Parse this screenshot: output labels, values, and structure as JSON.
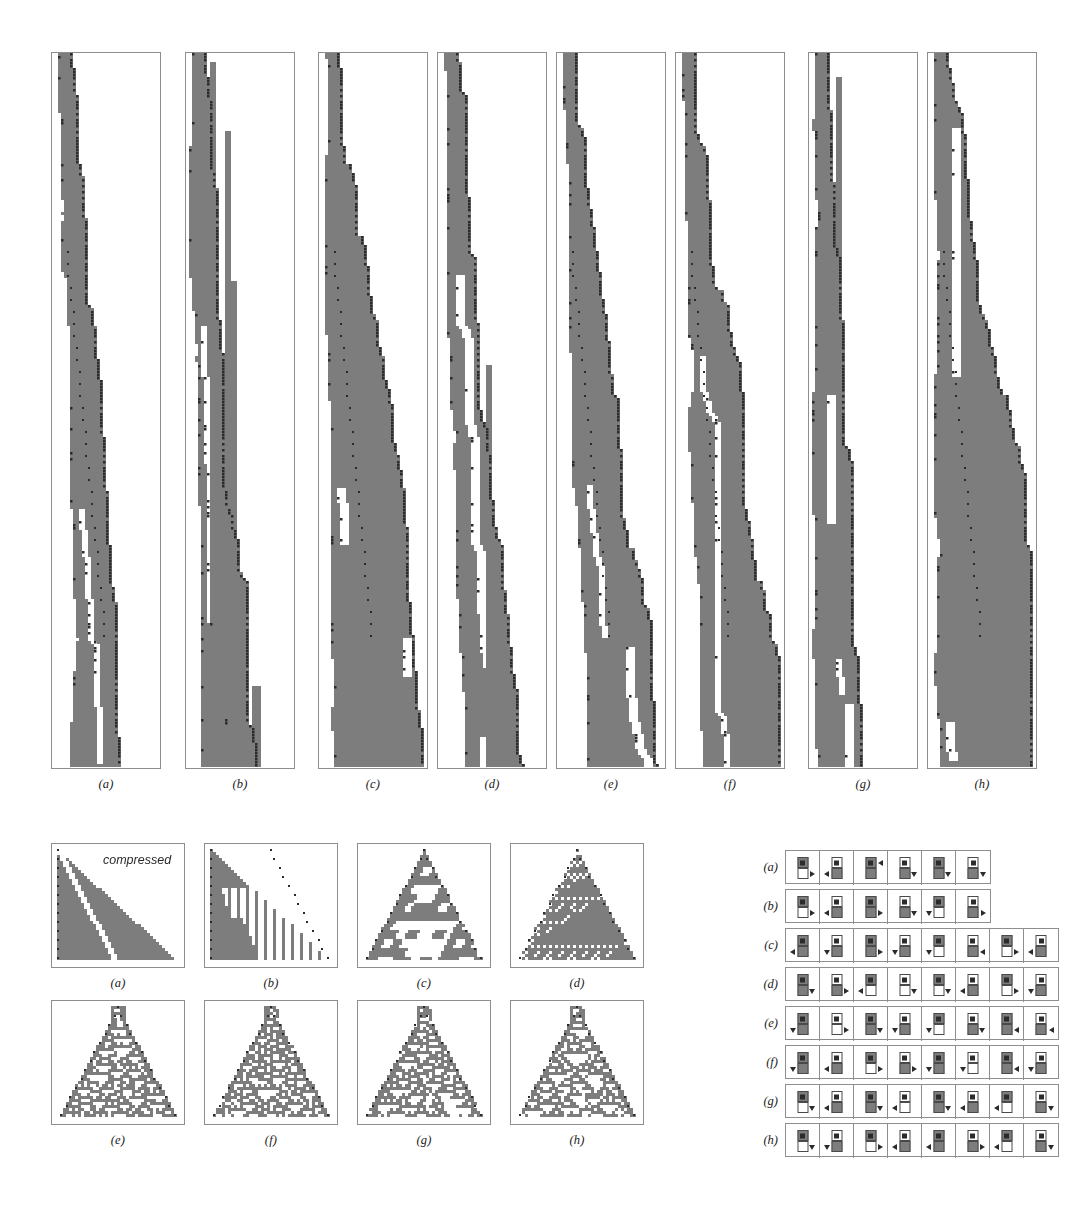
{
  "figure": {
    "background": "#ffffff",
    "cell_on_color": "#7d7d7d",
    "cell_off_color": "#ffffff",
    "head_marker_color": "#2b2b2b",
    "panel_border_color": "#8e8e8e"
  },
  "top_row": {
    "name": "long-evolution-strips",
    "panel_count": 8,
    "captions": [
      "(a)",
      "(b)",
      "(c)",
      "(d)",
      "(e)",
      "(f)",
      "(g)",
      "(h)"
    ]
  },
  "middle_block": {
    "name": "compressed-evolution-panels",
    "note": "compressed",
    "row1_captions": [
      "(a)",
      "(b)",
      "(c)",
      "(d)"
    ],
    "row2_captions": [
      "(e)",
      "(f)",
      "(g)",
      "(h)"
    ]
  },
  "rule_tables": {
    "name": "turing-machine-rule-tables",
    "rows": [
      {
        "label": "(a)",
        "cells": [
          {
            "in_state": "on",
            "out_state": "off",
            "move": "right",
            "arrow_pos": "out-right"
          },
          {
            "in_state": "off",
            "out_state": "on",
            "move": "left",
            "arrow_pos": "out-left"
          },
          {
            "in_state": "on",
            "out_state": "on",
            "move": "left",
            "arrow_pos": "in-right"
          },
          {
            "in_state": "off",
            "out_state": "on",
            "move": "down",
            "arrow_pos": "out-right"
          },
          {
            "in_state": "on",
            "out_state": "on",
            "move": "down",
            "arrow_pos": "out-right"
          },
          {
            "in_state": "off",
            "out_state": "on",
            "move": "down",
            "arrow_pos": "out-right"
          }
        ]
      },
      {
        "label": "(b)",
        "cells": [
          {
            "in_state": "on",
            "out_state": "off",
            "move": "right",
            "arrow_pos": "out-right"
          },
          {
            "in_state": "off",
            "out_state": "on",
            "move": "left",
            "arrow_pos": "out-left"
          },
          {
            "in_state": "on",
            "out_state": "on",
            "move": "right",
            "arrow_pos": "out-right"
          },
          {
            "in_state": "off",
            "out_state": "on",
            "move": "down",
            "arrow_pos": "out-right"
          },
          {
            "in_state": "on",
            "out_state": "off",
            "move": "down",
            "arrow_pos": "out-left"
          },
          {
            "in_state": "off",
            "out_state": "on",
            "move": "right",
            "arrow_pos": "out-right"
          }
        ]
      },
      {
        "label": "(c)",
        "cells": [
          {
            "in_state": "on",
            "out_state": "on",
            "move": "left",
            "arrow_pos": "out-left"
          },
          {
            "in_state": "off",
            "out_state": "on",
            "move": "down",
            "arrow_pos": "out-left"
          },
          {
            "in_state": "on",
            "out_state": "on",
            "move": "right",
            "arrow_pos": "out-right"
          },
          {
            "in_state": "off",
            "out_state": "on",
            "move": "down",
            "arrow_pos": "out-left"
          },
          {
            "in_state": "on",
            "out_state": "off",
            "move": "down",
            "arrow_pos": "out-left"
          },
          {
            "in_state": "off",
            "out_state": "on",
            "move": "left",
            "arrow_pos": "out-right"
          },
          {
            "in_state": "on",
            "out_state": "off",
            "move": "right",
            "arrow_pos": "out-right"
          },
          {
            "in_state": "off",
            "out_state": "on",
            "move": "left",
            "arrow_pos": "out-left"
          }
        ]
      },
      {
        "label": "(d)",
        "cells": [
          {
            "in_state": "on",
            "out_state": "on",
            "move": "down",
            "arrow_pos": "out-right"
          },
          {
            "in_state": "off",
            "out_state": "on",
            "move": "right",
            "arrow_pos": "out-right"
          },
          {
            "in_state": "on",
            "out_state": "off",
            "move": "left",
            "arrow_pos": "out-left"
          },
          {
            "in_state": "off",
            "out_state": "off",
            "move": "down",
            "arrow_pos": "out-right"
          },
          {
            "in_state": "on",
            "out_state": "off",
            "move": "down",
            "arrow_pos": "out-right"
          },
          {
            "in_state": "off",
            "out_state": "on",
            "move": "left",
            "arrow_pos": "out-left"
          },
          {
            "in_state": "on",
            "out_state": "off",
            "move": "right",
            "arrow_pos": "out-right"
          },
          {
            "in_state": "off",
            "out_state": "on",
            "move": "down",
            "arrow_pos": "out-left"
          }
        ]
      },
      {
        "label": "(e)",
        "cells": [
          {
            "in_state": "on",
            "out_state": "on",
            "move": "down",
            "arrow_pos": "out-left"
          },
          {
            "in_state": "off",
            "out_state": "off",
            "move": "right",
            "arrow_pos": "out-right"
          },
          {
            "in_state": "on",
            "out_state": "on",
            "move": "down",
            "arrow_pos": "out-right"
          },
          {
            "in_state": "off",
            "out_state": "on",
            "move": "down",
            "arrow_pos": "out-left"
          },
          {
            "in_state": "on",
            "out_state": "off",
            "move": "down",
            "arrow_pos": "out-left"
          },
          {
            "in_state": "off",
            "out_state": "on",
            "move": "down",
            "arrow_pos": "out-right"
          },
          {
            "in_state": "on",
            "out_state": "on",
            "move": "left",
            "arrow_pos": "out-right"
          },
          {
            "in_state": "off",
            "out_state": "on",
            "move": "left",
            "arrow_pos": "out-right"
          }
        ]
      },
      {
        "label": "(f)",
        "cells": [
          {
            "in_state": "on",
            "out_state": "on",
            "move": "down",
            "arrow_pos": "out-left"
          },
          {
            "in_state": "off",
            "out_state": "on",
            "move": "left",
            "arrow_pos": "out-left"
          },
          {
            "in_state": "on",
            "out_state": "off",
            "move": "right",
            "arrow_pos": "out-right"
          },
          {
            "in_state": "off",
            "out_state": "on",
            "move": "right",
            "arrow_pos": "out-right"
          },
          {
            "in_state": "on",
            "out_state": "on",
            "move": "down",
            "arrow_pos": "out-left"
          },
          {
            "in_state": "off",
            "out_state": "off",
            "move": "down",
            "arrow_pos": "out-left"
          },
          {
            "in_state": "on",
            "out_state": "on",
            "move": "left",
            "arrow_pos": "out-right"
          },
          {
            "in_state": "off",
            "out_state": "on",
            "move": "down",
            "arrow_pos": "out-left"
          }
        ]
      },
      {
        "label": "(g)",
        "cells": [
          {
            "in_state": "on",
            "out_state": "off",
            "move": "down",
            "arrow_pos": "out-right"
          },
          {
            "in_state": "off",
            "out_state": "on",
            "move": "left",
            "arrow_pos": "out-left"
          },
          {
            "in_state": "on",
            "out_state": "on",
            "move": "down",
            "arrow_pos": "out-right"
          },
          {
            "in_state": "off",
            "out_state": "off",
            "move": "left",
            "arrow_pos": "out-left"
          },
          {
            "in_state": "on",
            "out_state": "on",
            "move": "down",
            "arrow_pos": "out-right"
          },
          {
            "in_state": "off",
            "out_state": "on",
            "move": "left",
            "arrow_pos": "out-left"
          },
          {
            "in_state": "on",
            "out_state": "off",
            "move": "left",
            "arrow_pos": "out-left"
          },
          {
            "in_state": "off",
            "out_state": "on",
            "move": "down",
            "arrow_pos": "out-right"
          }
        ]
      },
      {
        "label": "(h)",
        "cells": [
          {
            "in_state": "on",
            "out_state": "off",
            "move": "down",
            "arrow_pos": "out-right"
          },
          {
            "in_state": "off",
            "out_state": "on",
            "move": "down",
            "arrow_pos": "out-left"
          },
          {
            "in_state": "on",
            "out_state": "off",
            "move": "right",
            "arrow_pos": "out-right"
          },
          {
            "in_state": "off",
            "out_state": "on",
            "move": "left",
            "arrow_pos": "out-left"
          },
          {
            "in_state": "on",
            "out_state": "on",
            "move": "left",
            "arrow_pos": "out-left"
          },
          {
            "in_state": "off",
            "out_state": "on",
            "move": "right",
            "arrow_pos": "out-right"
          },
          {
            "in_state": "on",
            "out_state": "off",
            "move": "left",
            "arrow_pos": "out-left"
          },
          {
            "in_state": "off",
            "out_state": "on",
            "move": "down",
            "arrow_pos": "out-right"
          }
        ]
      }
    ]
  },
  "chart_data": {
    "type": "heatmap",
    "title": "",
    "top_panels": [
      {
        "caption": "(a)",
        "x": 51,
        "y": 52,
        "w": 110,
        "h": 717,
        "seed": 11,
        "style": "spine",
        "drift": 0.62,
        "branch": 0.17,
        "diag": true
      },
      {
        "caption": "(b)",
        "x": 185,
        "y": 52,
        "w": 110,
        "h": 717,
        "seed": 22,
        "style": "comb",
        "drift": 0.55,
        "branch": 0.3,
        "diag": false
      },
      {
        "caption": "(c)",
        "x": 318,
        "y": 52,
        "w": 110,
        "h": 717,
        "seed": 33,
        "style": "zigzag",
        "drift": 0.5,
        "branch": 0.26,
        "diag": true
      },
      {
        "caption": "(d)",
        "x": 437,
        "y": 52,
        "w": 110,
        "h": 717,
        "seed": 44,
        "style": "comb",
        "drift": 0.58,
        "branch": 0.22,
        "diag": false
      },
      {
        "caption": "(e)",
        "x": 556,
        "y": 52,
        "w": 110,
        "h": 717,
        "seed": 55,
        "style": "zigzag",
        "drift": 0.54,
        "branch": 0.24,
        "diag": true
      },
      {
        "caption": "(f)",
        "x": 675,
        "y": 52,
        "w": 110,
        "h": 717,
        "seed": 66,
        "style": "spine",
        "drift": 0.6,
        "branch": 0.2,
        "diag": true
      },
      {
        "caption": "(g)",
        "x": 808,
        "y": 52,
        "w": 110,
        "h": 717,
        "seed": 77,
        "style": "comb",
        "drift": 0.52,
        "branch": 0.28,
        "diag": false
      },
      {
        "caption": "(h)",
        "x": 927,
        "y": 52,
        "w": 110,
        "h": 717,
        "seed": 88,
        "style": "zigzag",
        "drift": 0.48,
        "branch": 0.25,
        "diag": true
      }
    ],
    "middle_panels": [
      {
        "caption": "(a)",
        "x": 51,
        "y": 843,
        "w": 134,
        "h": 125,
        "seed": 101,
        "style": "solid-tri",
        "note": "compressed"
      },
      {
        "caption": "(b)",
        "x": 204,
        "y": 843,
        "w": 134,
        "h": 125,
        "seed": 202,
        "style": "striped-tri",
        "note": ""
      },
      {
        "caption": "(c)",
        "x": 357,
        "y": 843,
        "w": 134,
        "h": 125,
        "seed": 303,
        "style": "nested-tri",
        "note": ""
      },
      {
        "caption": "(d)",
        "x": 510,
        "y": 843,
        "w": 134,
        "h": 125,
        "seed": 404,
        "style": "fine-tri",
        "note": ""
      },
      {
        "caption": "(e)",
        "x": 51,
        "y": 1000,
        "w": 134,
        "h": 125,
        "seed": 505,
        "style": "random-tri",
        "note": ""
      },
      {
        "caption": "(f)",
        "x": 204,
        "y": 1000,
        "w": 134,
        "h": 125,
        "seed": 606,
        "style": "random-tri",
        "note": ""
      },
      {
        "caption": "(g)",
        "x": 357,
        "y": 1000,
        "w": 134,
        "h": 125,
        "seed": 707,
        "style": "random-tri",
        "note": ""
      },
      {
        "caption": "(h)",
        "x": 510,
        "y": 1000,
        "w": 134,
        "h": 125,
        "seed": 808,
        "style": "random-tri",
        "note": ""
      }
    ]
  }
}
